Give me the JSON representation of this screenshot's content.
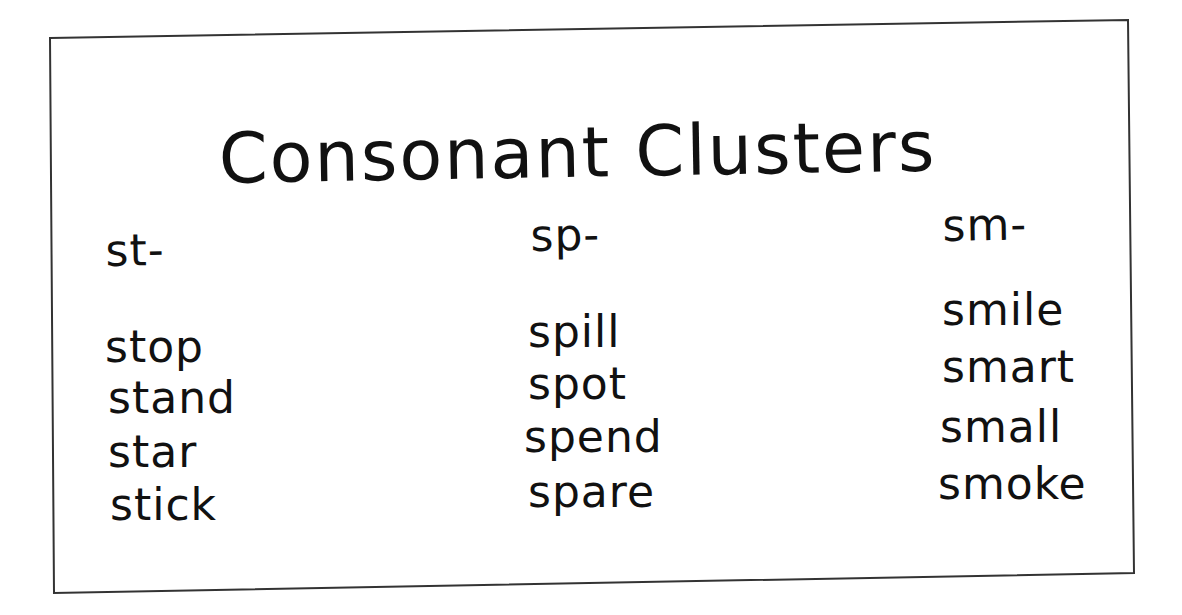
{
  "title": "Consonant Clusters",
  "columns": [
    {
      "header": "st-",
      "words": [
        "stop",
        "stand",
        "star",
        "stick"
      ]
    },
    {
      "header": "sp-",
      "words": [
        "spill",
        "spot",
        "spend",
        "spare"
      ]
    },
    {
      "header": "sm-",
      "words": [
        "smile",
        "smart",
        "small",
        "smoke"
      ]
    }
  ],
  "colors": {
    "ink": "#111111",
    "paper": "#ffffff",
    "border": "#333333"
  }
}
